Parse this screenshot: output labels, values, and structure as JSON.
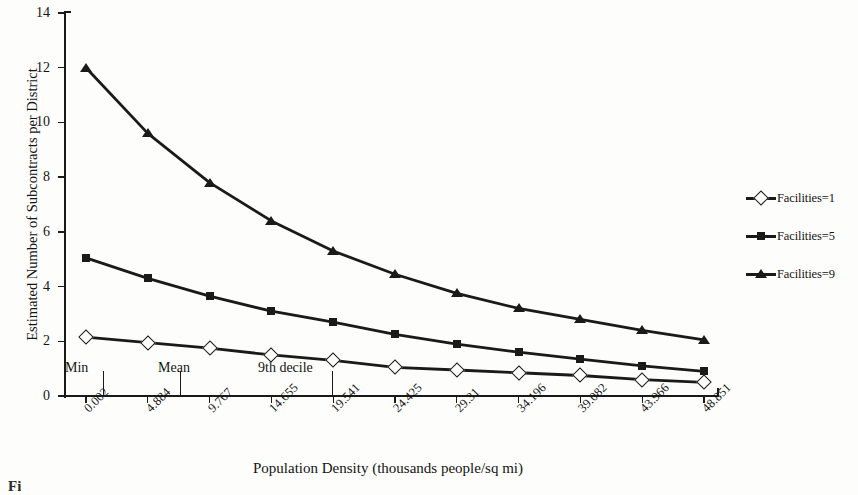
{
  "figure": {
    "title_cut_off": "",
    "caption_cut_off": "Fi",
    "paper_color": "#fdfdfb",
    "ink_color": "#1a1a1a"
  },
  "chart_data": {
    "type": "line",
    "title": "",
    "xlabel": "Population Density (thousands people/sq mi)",
    "ylabel": "Estimated Number of Subcontracts per District",
    "grid": false,
    "legend_position": "right",
    "ylim": [
      0,
      14
    ],
    "yticks": [
      0,
      2,
      4,
      6,
      8,
      10,
      12,
      14
    ],
    "ytick_labels": [
      "0",
      "2",
      "4",
      "6",
      "8",
      "10",
      "12",
      "14"
    ],
    "categories": [
      "0.002",
      "4.884",
      "9.767",
      "14.655",
      "19.541",
      "24.425",
      "29.31",
      "34.196",
      "39.082",
      "43.966",
      "48.851"
    ],
    "x": [
      0.002,
      4.884,
      9.767,
      14.655,
      19.541,
      24.425,
      29.31,
      34.196,
      39.082,
      43.966,
      48.851
    ],
    "series": [
      {
        "name": "Facilities=1",
        "marker": "open-diamond",
        "values": [
          2.15,
          1.95,
          1.75,
          1.5,
          1.3,
          1.05,
          0.95,
          0.85,
          0.75,
          0.6,
          0.5
        ]
      },
      {
        "name": "Facilities=5",
        "marker": "filled-square",
        "values": [
          5.05,
          4.3,
          3.65,
          3.1,
          2.7,
          2.25,
          1.9,
          1.6,
          1.35,
          1.1,
          0.9
        ]
      },
      {
        "name": "Facilities=9",
        "marker": "filled-triangle",
        "values": [
          12.0,
          9.6,
          7.8,
          6.4,
          5.3,
          4.45,
          3.75,
          3.2,
          2.8,
          2.4,
          2.05
        ]
      }
    ],
    "annotations": [
      {
        "label": "Min",
        "x_value": 0.002,
        "x_pixel": 103
      },
      {
        "label": "Mean",
        "x_value": 4.884,
        "x_pixel": 180
      },
      {
        "label": "9th decile",
        "x_value": 19.541,
        "x_pixel": 332
      }
    ]
  }
}
